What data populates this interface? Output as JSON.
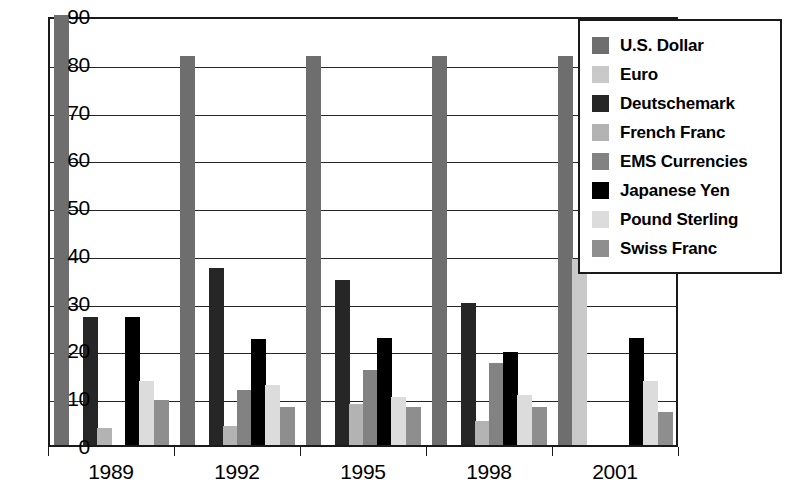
{
  "chart_data": {
    "type": "bar",
    "title": "",
    "subtitle": "",
    "xlabel": "",
    "ylabel": "",
    "categories": [
      "1989",
      "1992",
      "1995",
      "1998",
      "2001"
    ],
    "ylim": [
      0,
      90
    ],
    "yticks": [
      0,
      10,
      20,
      30,
      40,
      50,
      60,
      70,
      80,
      90
    ],
    "ytick_labels": [
      "0",
      "10",
      "20",
      "30",
      "40",
      "50",
      "60",
      "70",
      "80",
      "90"
    ],
    "grid": true,
    "legend_position": "top-right-inside",
    "series": [
      {
        "name": "U.S. Dollar",
        "color": "#6e6e6e",
        "values": [
          90.0,
          81.5,
          81.5,
          81.5,
          81.5
        ]
      },
      {
        "name": "Euro",
        "color": "#c9c9c9",
        "values": [
          null,
          null,
          null,
          null,
          39.0
        ]
      },
      {
        "name": "Deutschemark",
        "color": "#262626",
        "values": [
          26.8,
          37.0,
          34.5,
          29.7,
          null
        ]
      },
      {
        "name": "French Franc",
        "color": "#b3b3b3",
        "values": [
          3.5,
          4.0,
          8.5,
          5.0,
          null
        ]
      },
      {
        "name": "EMS Currencies",
        "color": "#828282",
        "values": [
          null,
          11.5,
          15.8,
          17.2,
          null
        ]
      },
      {
        "name": "Japanese Yen",
        "color": "#000000",
        "values": [
          26.8,
          22.2,
          22.5,
          19.5,
          22.5
        ]
      },
      {
        "name": "Pound Sterling",
        "color": "#dcdcdc",
        "values": [
          13.5,
          12.5,
          10.0,
          10.5,
          13.5
        ]
      },
      {
        "name": "Swiss Franc",
        "color": "#8e8e8e",
        "values": [
          9.5,
          8.0,
          8.0,
          8.0,
          7.0
        ]
      }
    ]
  },
  "legend": {
    "items": [
      {
        "label": "U.S. Dollar",
        "color": "#6e6e6e"
      },
      {
        "label": "Euro",
        "color": "#c9c9c9"
      },
      {
        "label": "Deutschemark",
        "color": "#262626"
      },
      {
        "label": "French Franc",
        "color": "#b3b3b3"
      },
      {
        "label": "EMS Currencies",
        "color": "#828282"
      },
      {
        "label": "Japanese Yen",
        "color": "#000000"
      },
      {
        "label": "Pound Sterling",
        "color": "#dcdcdc"
      },
      {
        "label": "Swiss Franc",
        "color": "#8e8e8e"
      }
    ]
  }
}
